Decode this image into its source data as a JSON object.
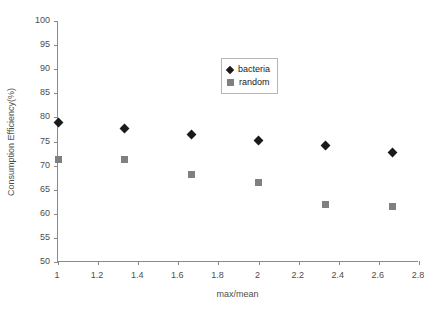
{
  "chart_data": {
    "type": "scatter",
    "title": "",
    "xlabel": "max/mean",
    "ylabel": "Consumption Efficiency(%)",
    "xlim": [
      1,
      2.8
    ],
    "ylim": [
      50,
      100
    ],
    "xticks": [
      "1",
      "1.2",
      "1.4",
      "1.6",
      "1.8",
      "2",
      "2.2",
      "2.4",
      "2.6",
      "2.8"
    ],
    "xtick_values": [
      1,
      1.2,
      1.4,
      1.6,
      1.8,
      2,
      2.2,
      2.4,
      2.6,
      2.8
    ],
    "yticks": [
      "50",
      "55",
      "60",
      "65",
      "70",
      "75",
      "80",
      "85",
      "90",
      "95",
      "100"
    ],
    "ytick_values": [
      50,
      55,
      60,
      65,
      70,
      75,
      80,
      85,
      90,
      95,
      100
    ],
    "grid": false,
    "legend_position": "upper-center",
    "x": [
      1,
      1.333,
      1.667,
      2,
      2.333,
      2.667
    ],
    "series": [
      {
        "name": "bacteria",
        "marker": "diamond",
        "color": "#1a1a1a",
        "values": [
          79.0,
          77.7,
          76.5,
          75.2,
          74.1,
          72.8
        ]
      },
      {
        "name": "random",
        "marker": "square",
        "color": "#808080",
        "values": [
          71.3,
          71.2,
          68.1,
          66.5,
          62.0,
          61.6
        ]
      }
    ]
  },
  "legend": {
    "entries": [
      {
        "label": "bacteria",
        "marker": "diamond"
      },
      {
        "label": "random",
        "marker": "square"
      }
    ]
  },
  "caption_fragment": ""
}
